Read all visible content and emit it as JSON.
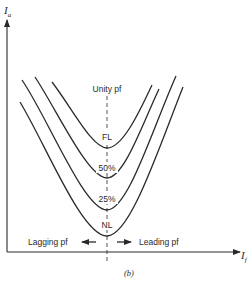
{
  "figure": {
    "caption": "(b)",
    "y_axis_label": "I",
    "y_axis_subscript": "a",
    "x_axis_label": "I",
    "x_axis_subscript": "f",
    "unity_label": "Unity pf",
    "lagging_label": "Lagging pf",
    "leading_label": "Leading pf",
    "curves": [
      {
        "label": "FL",
        "min_y": 148,
        "left": [
          52,
          82
        ],
        "right": [
          152,
          85
        ]
      },
      {
        "label": "50%",
        "min_y": 178,
        "left": [
          35,
          77
        ],
        "right": [
          159,
          89
        ]
      },
      {
        "label": "25%",
        "min_y": 210,
        "left": [
          22,
          80
        ],
        "right": [
          176,
          76
        ]
      },
      {
        "label": "NL",
        "min_y": 236,
        "left": [
          20,
          102
        ],
        "right": [
          183,
          87
        ]
      }
    ]
  },
  "colors": {
    "line": "#2a2a2a",
    "background": "#ffffff"
  }
}
